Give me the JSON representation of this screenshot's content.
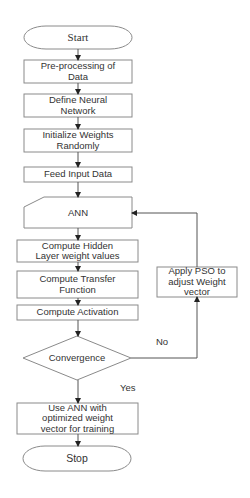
{
  "diagram": {
    "type": "flowchart",
    "nodes": {
      "start": {
        "label": "Start",
        "shape": "terminator"
      },
      "preprocess": {
        "label": "Pre-processing of\nData",
        "shape": "process"
      },
      "define_nn": {
        "label": "Define Neural\nNetwork",
        "shape": "process"
      },
      "init_weights": {
        "label": "Initialize Weights\nRandomly",
        "shape": "process"
      },
      "feed_input": {
        "label": "Feed Input Data",
        "shape": "process"
      },
      "ann": {
        "label": "ANN",
        "shape": "manual-input"
      },
      "compute_hidden": {
        "label": "Compute Hidden\nLayer weight values",
        "shape": "process"
      },
      "compute_transfer": {
        "label": "Compute Transfer\nFunction",
        "shape": "process"
      },
      "compute_activation": {
        "label": "Compute Activation",
        "shape": "process"
      },
      "convergence": {
        "label": "Convergence",
        "shape": "decision"
      },
      "apply_pso": {
        "label": "Apply PSO to\nadjust Weight\nvector",
        "shape": "process"
      },
      "use_ann": {
        "label": "Use ANN with\noptimized weight\nvector for training",
        "shape": "process"
      },
      "stop": {
        "label": "Stop",
        "shape": "terminator"
      }
    },
    "edges": {
      "no_label": "No",
      "yes_label": "Yes"
    },
    "colors": {
      "stroke": "#8a8a8a",
      "line": "#555555",
      "arrow": "#222222",
      "text": "#333333",
      "background": "#ffffff"
    }
  }
}
